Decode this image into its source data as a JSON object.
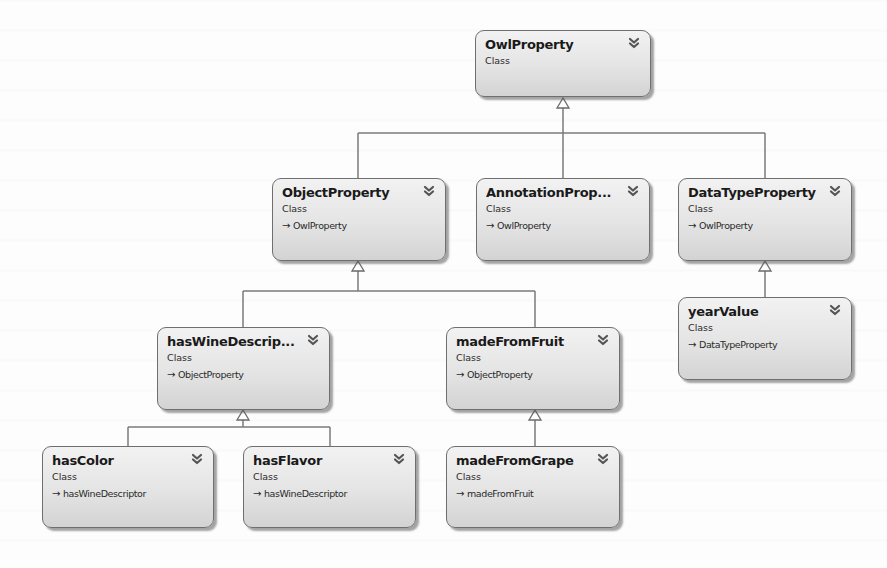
{
  "diagram": {
    "type": "UML class inheritance diagram",
    "colors": {
      "node_fill_top": "#f2f2f2",
      "node_fill_bottom": "#d3d3d3",
      "node_border": "#6f6f6f",
      "connector": "#7a7a7a"
    },
    "nodes": {
      "owlproperty": {
        "title": "OwlProperty",
        "kind": "Class",
        "parent": "",
        "icon": "double-chevron-down-icon"
      },
      "objectproperty": {
        "title": "ObjectProperty",
        "kind": "Class",
        "parent": "OwlProperty",
        "icon": "double-chevron-down-icon"
      },
      "annotationproperty": {
        "title": "AnnotationProp...",
        "kind": "Class",
        "parent": "OwlProperty",
        "icon": "double-chevron-down-icon"
      },
      "datatypeproperty": {
        "title": "DataTypeProperty",
        "kind": "Class",
        "parent": "OwlProperty",
        "icon": "double-chevron-down-icon"
      },
      "haswinedescriptor": {
        "title": "hasWineDescrip...",
        "kind": "Class",
        "parent": "ObjectProperty",
        "icon": "double-chevron-down-icon"
      },
      "madefromfruit": {
        "title": "madeFromFruit",
        "kind": "Class",
        "parent": "ObjectProperty",
        "icon": "double-chevron-down-icon"
      },
      "yearvalue": {
        "title": "yearValue",
        "kind": "Class",
        "parent": "DataTypeProperty",
        "icon": "double-chevron-down-icon"
      },
      "hascolor": {
        "title": "hasColor",
        "kind": "Class",
        "parent": "hasWineDescriptor",
        "icon": "double-chevron-down-icon"
      },
      "hasflavor": {
        "title": "hasFlavor",
        "kind": "Class",
        "parent": "hasWineDescriptor",
        "icon": "double-chevron-down-icon"
      },
      "madefromgrape": {
        "title": "madeFromGrape",
        "kind": "Class",
        "parent": "madeFromFruit",
        "icon": "double-chevron-down-icon"
      }
    },
    "inheritance_arrow": "→",
    "edges": [
      {
        "from": "ObjectProperty",
        "to": "OwlProperty"
      },
      {
        "from": "AnnotationProp...",
        "to": "OwlProperty"
      },
      {
        "from": "DataTypeProperty",
        "to": "OwlProperty"
      },
      {
        "from": "hasWineDescrip...",
        "to": "ObjectProperty"
      },
      {
        "from": "madeFromFruit",
        "to": "ObjectProperty"
      },
      {
        "from": "yearValue",
        "to": "DataTypeProperty"
      },
      {
        "from": "hasColor",
        "to": "hasWineDescrip..."
      },
      {
        "from": "hasFlavor",
        "to": "hasWineDescrip..."
      },
      {
        "from": "madeFromGrape",
        "to": "madeFromFruit"
      }
    ]
  }
}
